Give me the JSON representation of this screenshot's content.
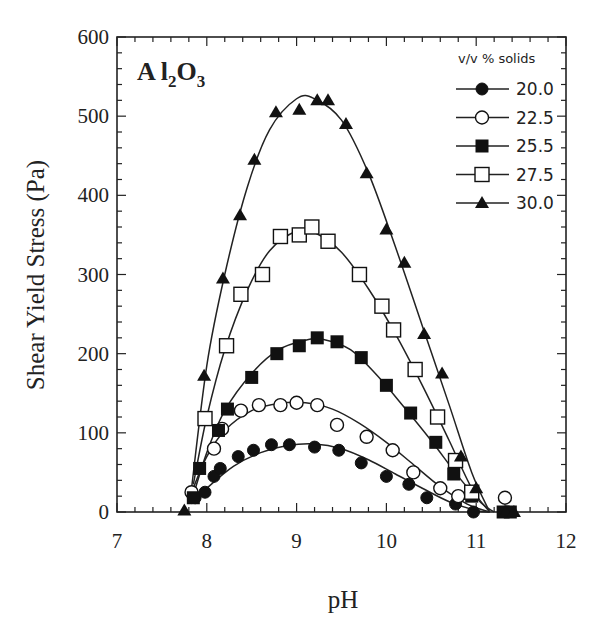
{
  "chart_data": {
    "type": "scatter",
    "title": "",
    "annotation": {
      "text": "Al",
      "sub1": "2",
      "mid": "O",
      "sub2": "3"
    },
    "xlabel": "pH",
    "ylabel": "Shear Yield Stress (Pa)",
    "xlim": [
      7,
      12
    ],
    "ylim": [
      0,
      600
    ],
    "xticks": [
      7,
      8,
      9,
      10,
      11,
      12
    ],
    "yticks": [
      0,
      100,
      200,
      300,
      400,
      500,
      600
    ],
    "grid": false,
    "legend": {
      "title": "v/v % solids",
      "position": "upper right"
    },
    "series": [
      {
        "name": "20.0",
        "marker": "filled-circle",
        "x": [
          7.87,
          7.98,
          8.08,
          8.15,
          8.35,
          8.52,
          8.72,
          8.92,
          9.2,
          9.47,
          9.72,
          10.0,
          10.25,
          10.45,
          10.77,
          10.97
        ],
        "y": [
          18,
          25,
          45,
          55,
          70,
          78,
          85,
          85,
          82,
          78,
          62,
          45,
          35,
          18,
          10,
          0
        ],
        "fit_peak": {
          "x": 9.2,
          "y": 86
        }
      },
      {
        "name": "22.5",
        "marker": "open-circle",
        "x": [
          7.83,
          8.08,
          8.17,
          8.38,
          8.58,
          8.82,
          9.0,
          9.23,
          9.45,
          9.78,
          10.07,
          10.3,
          10.6,
          10.8,
          11.32
        ],
        "y": [
          25,
          80,
          105,
          128,
          135,
          135,
          138,
          135,
          110,
          95,
          78,
          50,
          30,
          20,
          18
        ],
        "fit_peak": {
          "x": 9.1,
          "y": 138
        }
      },
      {
        "name": "25.5",
        "marker": "filled-square",
        "x": [
          7.85,
          7.92,
          8.13,
          8.23,
          8.5,
          8.78,
          9.03,
          9.23,
          9.45,
          9.72,
          10.0,
          10.27,
          10.55,
          10.75,
          10.95,
          11.3,
          11.38
        ],
        "y": [
          18,
          55,
          103,
          130,
          170,
          200,
          210,
          220,
          215,
          195,
          160,
          125,
          88,
          48,
          20,
          0,
          0
        ],
        "fit_peak": {
          "x": 9.2,
          "y": 218
        }
      },
      {
        "name": "27.5",
        "marker": "open-square",
        "x": [
          7.98,
          8.22,
          8.38,
          8.62,
          8.82,
          9.03,
          9.17,
          9.35,
          9.7,
          9.95,
          10.08,
          10.32,
          10.57,
          10.77,
          10.95
        ],
        "y": [
          118,
          210,
          275,
          300,
          348,
          350,
          360,
          342,
          300,
          260,
          230,
          180,
          120,
          65,
          25
        ],
        "fit_peak": {
          "x": 9.05,
          "y": 355
        }
      },
      {
        "name": "30.0",
        "marker": "filled-triangle",
        "x": [
          7.75,
          7.97,
          8.18,
          8.37,
          8.53,
          8.77,
          9.03,
          9.23,
          9.35,
          9.55,
          9.78,
          10.0,
          10.2,
          10.42,
          10.62,
          10.83,
          11.0,
          11.33,
          11.42
        ],
        "y": [
          2,
          172,
          295,
          375,
          445,
          505,
          508,
          520,
          520,
          490,
          428,
          357,
          315,
          225,
          175,
          70,
          30,
          0,
          0
        ],
        "fit_peak": {
          "x": 9.05,
          "y": 523
        }
      }
    ]
  }
}
